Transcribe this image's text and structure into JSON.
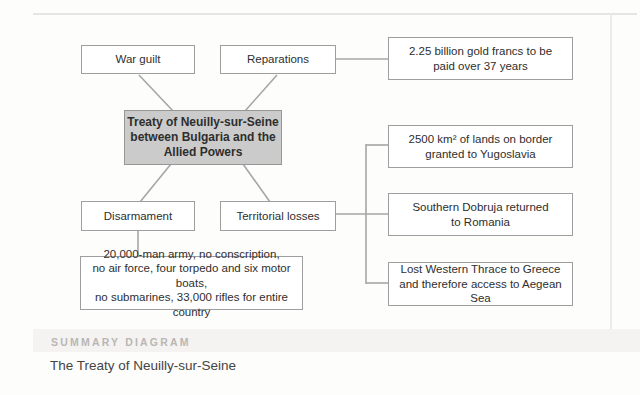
{
  "diagram": {
    "center": {
      "lines": [
        "Treaty of Neuilly-sur-Seine",
        "between Bulgaria and the",
        "Allied Powers"
      ]
    },
    "nodes": {
      "war_guilt": {
        "label": "War guilt"
      },
      "reparations": {
        "label": "Reparations"
      },
      "disarmament": {
        "label": "Disarmament"
      },
      "territorial_losses": {
        "label": "Territorial losses"
      },
      "reparations_detail": {
        "lines": [
          "2.25 billion gold francs to be",
          "paid over 37 years"
        ]
      },
      "yugoslavia_detail": {
        "lines": [
          "2500 km² of lands on border",
          "granted to Yugoslavia"
        ]
      },
      "romania_detail": {
        "lines": [
          "Southern Dobruja returned",
          "to Romania"
        ]
      },
      "greece_detail": {
        "lines": [
          "Lost Western Thrace to Greece",
          "and therefore access to Aegean Sea"
        ]
      },
      "disarmament_detail": {
        "lines": [
          "20,000-man army, no conscription,",
          "no air force, four torpedo and six motor boats,",
          "no submarines, 33,000 rifles for entire country"
        ]
      }
    }
  },
  "caption": {
    "kicker": "SUMMARY DIAGRAM",
    "title": "The Treaty of Neuilly-sur-Seine"
  },
  "colors": {
    "box_border": "#9e9e9e",
    "line": "#a6a6a6",
    "center_fill": "#cbcbcb",
    "center_border": "#979797",
    "text": "#2e2e2e",
    "kicker": "#b9b7b4",
    "title": "#454443",
    "band": "#f4f3f1",
    "page": "#fdfdfc"
  }
}
